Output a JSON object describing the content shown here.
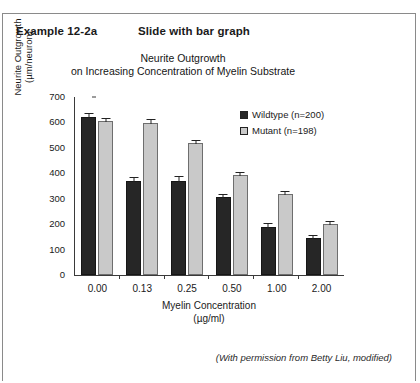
{
  "header": {
    "example_label": "Example 12-2a",
    "slide_label": "Slide with bar graph"
  },
  "credit": "(With permission from Betty Liu, modified)",
  "colors": {
    "wildtype": "#262626",
    "mutant": "#c9c9c9",
    "axis": "#3a3a3a",
    "frame": "#8a8a8a"
  },
  "chart_data": {
    "type": "bar",
    "title_line1": "Neurite Outgrowth",
    "title_line2": "on Increasing Concentration of Myelin Substrate",
    "xlabel_line1": "Myelin Concentration",
    "xlabel_line2": "(µg/ml)",
    "ylabel_line1": "Neurite Outgrowth",
    "ylabel_line2": "(µm/neuron)",
    "categories": [
      "0.00",
      "0.13",
      "0.25",
      "0.50",
      "1.00",
      "2.00"
    ],
    "ylim": [
      0,
      700
    ],
    "yticks": [
      "0",
      "100",
      "200",
      "300",
      "400",
      "500",
      "600",
      "700"
    ],
    "grid": false,
    "legend_position": "top-right",
    "series": [
      {
        "name": "Wildtype (n=200)",
        "key": "wildtype",
        "values": [
          620,
          370,
          370,
          305,
          190,
          145
        ],
        "errors": [
          22,
          20,
          22,
          18,
          18,
          16
        ]
      },
      {
        "name": "Mutant (n=198)",
        "key": "mutant",
        "values": [
          605,
          598,
          518,
          393,
          320,
          200
        ],
        "errors": [
          18,
          20,
          18,
          16,
          16,
          18
        ]
      }
    ]
  }
}
